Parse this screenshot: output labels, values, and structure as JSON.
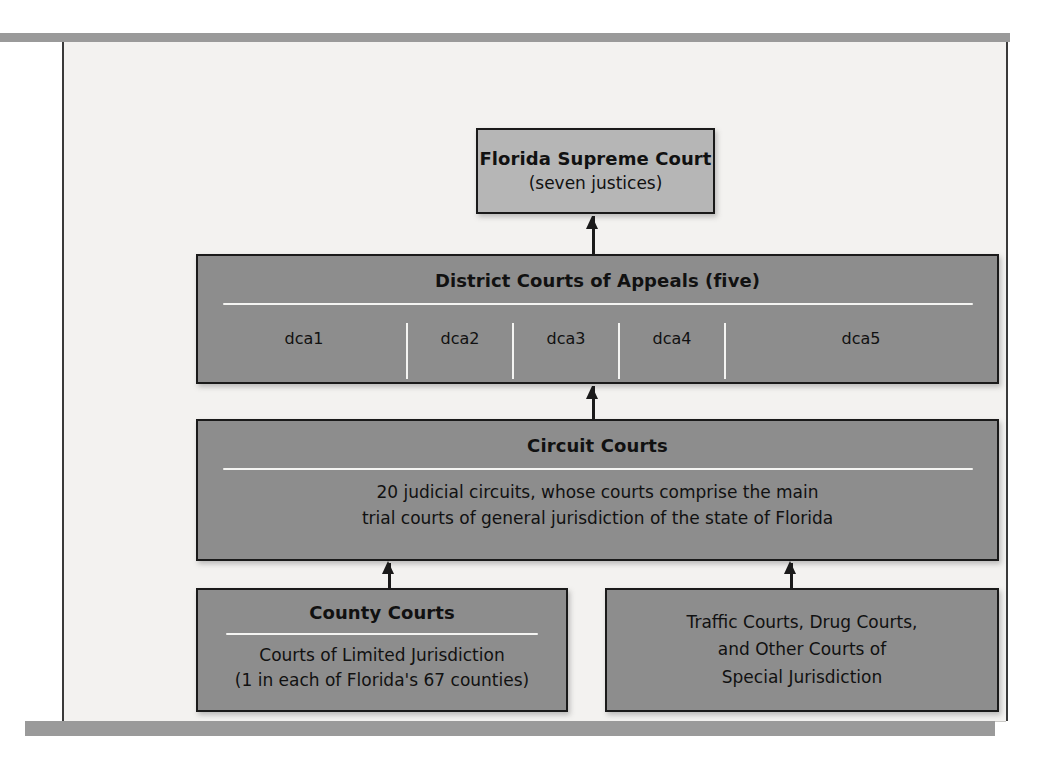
{
  "figure": {
    "kind": "court-system-hierarchy-diagram"
  },
  "nodes": {
    "supreme": {
      "title": "Florida Supreme Court",
      "subtitle": "(seven justices)"
    },
    "district_courts": {
      "title": "District Courts of Appeals (five)",
      "divisions": [
        "dca1",
        "dca2",
        "dca3",
        "dca4",
        "dca5"
      ]
    },
    "circuit": {
      "title": "Circuit Courts",
      "line1": "20 judicial circuits, whose courts comprise the main",
      "line2": "trial courts of general jurisdiction of the state of Florida"
    },
    "county": {
      "title": "County Courts",
      "line1": "Courts of Limited Jurisdiction",
      "line2": "(1 in each of Florida's 67 counties)"
    },
    "special": {
      "line1": "Traffic Courts, Drug Courts,",
      "line2": "and Other Courts of",
      "line3": "Special Jurisdiction"
    }
  },
  "colors": {
    "box_fill": "#8d8d8d",
    "box_fill_light": "#b6b6b6",
    "box_border": "#1a1a1a",
    "panel_background": "#f3f2f0",
    "rule_bar": "#9a9a9a",
    "divider": "#f4f4f2"
  }
}
